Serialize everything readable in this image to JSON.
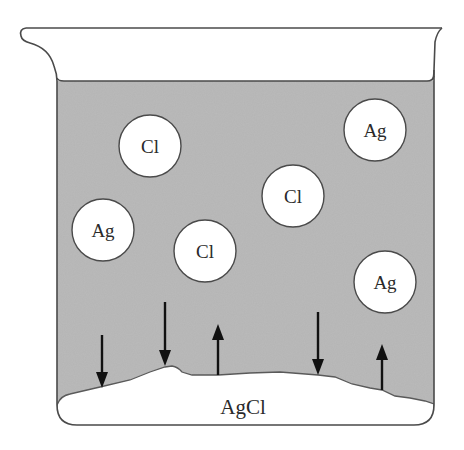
{
  "diagram": {
    "type": "beaker-equilibrium",
    "colors": {
      "liquid": "#b4b4b4",
      "outline": "#4a4a4a",
      "ion_fill": "#ffffff",
      "arrow": "#111111",
      "solid": "#ffffff"
    },
    "ions": [
      {
        "label": "Cl",
        "cx": 150,
        "cy": 146
      },
      {
        "label": "Ag",
        "cx": 375,
        "cy": 130
      },
      {
        "label": "Cl",
        "cx": 293,
        "cy": 196
      },
      {
        "label": "Ag",
        "cx": 103,
        "cy": 230
      },
      {
        "label": "Cl",
        "cx": 205,
        "cy": 251
      },
      {
        "label": "Ag",
        "cx": 385,
        "cy": 282
      }
    ],
    "arrows": [
      {
        "direction": "down",
        "x": 102
      },
      {
        "direction": "down",
        "x": 165
      },
      {
        "direction": "up",
        "x": 218
      },
      {
        "direction": "down",
        "x": 318
      },
      {
        "direction": "up",
        "x": 382
      }
    ],
    "solid_label": "AgCl"
  }
}
